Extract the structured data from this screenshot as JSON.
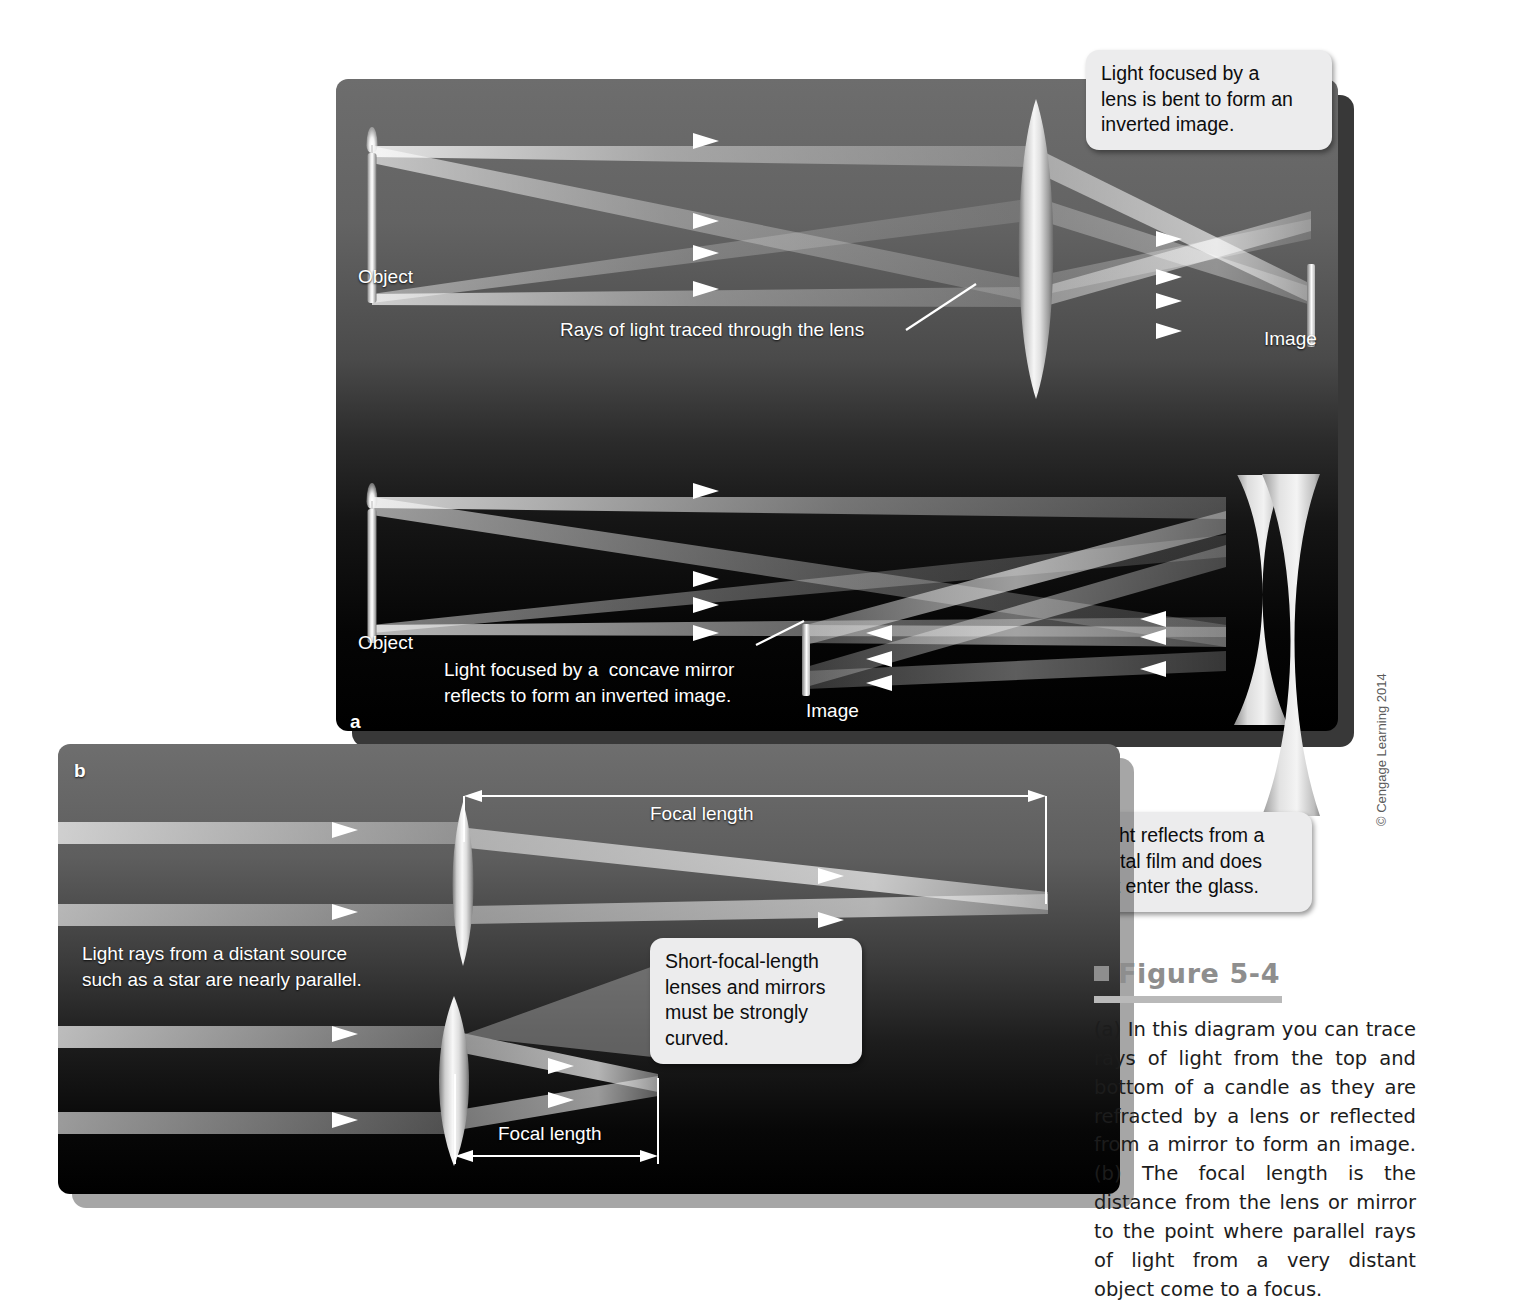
{
  "figure": {
    "number": "Figure 5-4",
    "caption": "(a) In this diagram you can trace rays of light from the top and bottom of a candle as they are refracted by a lens or reflected from a mirror to form an image. (b) The focal length is the distance from the lens or mirror to the point where parallel rays of light from a very distant object come to a focus.",
    "credit": "© Cengage Learning 2014",
    "accent_color": "#8e8e8e",
    "rule_color": "#b9b9b9"
  },
  "panel_a": {
    "letter": "a",
    "lens_scene": {
      "object_label": "Object",
      "image_label": "Image",
      "ray_label": "Rays of light traced through the lens",
      "callout": "Light focused by a\nlens is bent to form an\ninverted image."
    },
    "mirror_scene": {
      "object_label": "Object",
      "image_label": "Image",
      "note": "Light focused by a  concave mirror\nreflects to form an inverted image.",
      "callout": "Light reflects from a\nmetal film and does\nnot enter the glass."
    }
  },
  "panel_b": {
    "letter": "b",
    "parallel_note": "Light rays from a distant source\nsuch as a star are nearly parallel.",
    "long_focal_label": "Focal length",
    "short_focal_label": "Focal length",
    "callout": "Short-focal-length\nlenses and mirrors\nmust be strongly\ncurved."
  }
}
